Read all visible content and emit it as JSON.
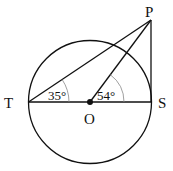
{
  "diagram": {
    "points": {
      "T": "T",
      "S": "S",
      "O": "O",
      "P": "P"
    },
    "angles": {
      "PTS": "35°",
      "POS": "54°"
    }
  }
}
